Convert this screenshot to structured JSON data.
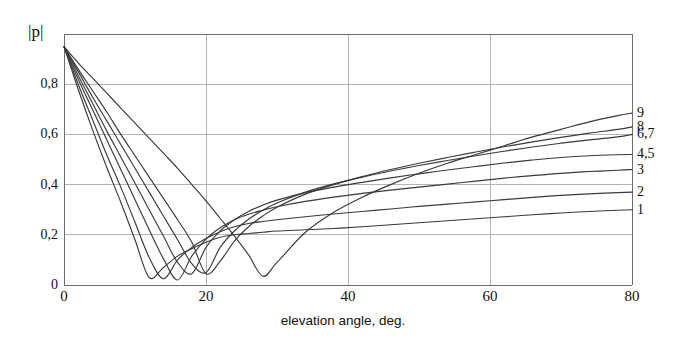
{
  "chart_data": {
    "type": "line",
    "title": "",
    "xlabel": "elevation angle, deg.",
    "ylabel": "|p|",
    "xlim": [
      0,
      80
    ],
    "ylim": [
      0,
      1.0
    ],
    "grid": true,
    "legend_position": "right-of-axes (curve end labels)",
    "xticks": [
      "0",
      "20",
      "40",
      "60",
      "80"
    ],
    "xtick_values": [
      0,
      20,
      40,
      60,
      80
    ],
    "yticks": [
      "0",
      "0,2",
      "0,4",
      "0,6",
      "0,8"
    ],
    "ytick_values": [
      0,
      0.2,
      0.4,
      0.6,
      0.8
    ],
    "decimal_separator": "comma",
    "line_color": "#3a3a3a",
    "grid_color": "#b4b4b4",
    "axis_color": "#6e6e6e",
    "x": [
      0,
      2,
      4,
      6,
      8,
      10,
      12,
      14,
      16,
      18,
      20,
      22,
      24,
      26,
      28,
      30,
      34,
      38,
      42,
      46,
      50,
      54,
      58,
      62,
      66,
      70,
      74,
      78,
      80
    ],
    "series": [
      {
        "name": "1",
        "label": "1",
        "end_value": 0.3,
        "minimum_x": 11,
        "values": [
          0.95,
          0.78,
          0.62,
          0.47,
          0.33,
          0.18,
          0.03,
          0.07,
          0.115,
          0.145,
          0.17,
          0.19,
          0.2,
          0.205,
          0.21,
          0.215,
          0.22,
          0.225,
          0.232,
          0.24,
          0.248,
          0.256,
          0.264,
          0.272,
          0.28,
          0.287,
          0.293,
          0.298,
          0.3
        ]
      },
      {
        "name": "2",
        "label": "2",
        "end_value": 0.37,
        "minimum_x": 12.4,
        "values": [
          0.95,
          0.8,
          0.66,
          0.52,
          0.39,
          0.25,
          0.11,
          0.025,
          0.1,
          0.15,
          0.185,
          0.212,
          0.232,
          0.245,
          0.253,
          0.26,
          0.272,
          0.283,
          0.293,
          0.303,
          0.313,
          0.322,
          0.331,
          0.34,
          0.349,
          0.357,
          0.363,
          0.368,
          0.37
        ]
      },
      {
        "name": "3",
        "label": "3",
        "end_value": 0.46,
        "minimum_x": 14.6,
        "values": [
          0.95,
          0.82,
          0.7,
          0.58,
          0.46,
          0.34,
          0.22,
          0.105,
          0.02,
          0.115,
          0.183,
          0.228,
          0.26,
          0.282,
          0.298,
          0.312,
          0.333,
          0.35,
          0.365,
          0.378,
          0.39,
          0.402,
          0.414,
          0.426,
          0.436,
          0.445,
          0.452,
          0.457,
          0.46
        ]
      },
      {
        "name": "4,5",
        "label": "4,5",
        "end_value": 0.52,
        "minimum_x": 16.2,
        "values": [
          0.95,
          0.835,
          0.725,
          0.615,
          0.51,
          0.405,
          0.3,
          0.195,
          0.09,
          0.045,
          0.15,
          0.215,
          0.26,
          0.293,
          0.318,
          0.338,
          0.368,
          0.39,
          0.409,
          0.427,
          0.443,
          0.458,
          0.472,
          0.486,
          0.498,
          0.508,
          0.515,
          0.519,
          0.52
        ]
      },
      {
        "name": "6,7",
        "label": "6,7",
        "end_value": 0.6,
        "minimum_x": 18.2,
        "values": [
          0.95,
          0.85,
          0.75,
          0.655,
          0.56,
          0.465,
          0.37,
          0.275,
          0.18,
          0.085,
          0.05,
          0.15,
          0.215,
          0.262,
          0.298,
          0.327,
          0.37,
          0.403,
          0.43,
          0.454,
          0.476,
          0.496,
          0.515,
          0.533,
          0.55,
          0.565,
          0.578,
          0.59,
          0.6
        ]
      },
      {
        "name": "8",
        "label": "8",
        "end_value": 0.63,
        "minimum_x": 20,
        "values": [
          0.95,
          0.86,
          0.775,
          0.69,
          0.6,
          0.515,
          0.43,
          0.345,
          0.26,
          0.17,
          0.045,
          0.095,
          0.175,
          0.232,
          0.275,
          0.31,
          0.362,
          0.4,
          0.432,
          0.46,
          0.485,
          0.508,
          0.53,
          0.551,
          0.57,
          0.588,
          0.605,
          0.62,
          0.63
        ]
      },
      {
        "name": "9",
        "label": "9",
        "end_value": 0.685,
        "minimum_x": 28,
        "values": [
          0.95,
          0.885,
          0.825,
          0.765,
          0.705,
          0.645,
          0.585,
          0.525,
          0.465,
          0.4,
          0.335,
          0.265,
          0.195,
          0.12,
          0.035,
          0.09,
          0.21,
          0.29,
          0.35,
          0.4,
          0.445,
          0.485,
          0.52,
          0.555,
          0.59,
          0.62,
          0.65,
          0.675,
          0.685
        ]
      }
    ]
  },
  "plot": {
    "left_px": 64,
    "right_px": 632,
    "top_px": 34,
    "bottom_px": 285
  }
}
